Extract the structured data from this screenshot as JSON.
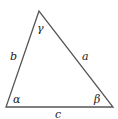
{
  "diagram": {
    "type": "triangle",
    "vertices": {
      "top": [
        39,
        11
      ],
      "bottom_left": [
        6,
        107
      ],
      "bottom_right": [
        113,
        107
      ]
    },
    "sides": {
      "a": "a",
      "b": "b",
      "c": "c"
    },
    "angles": {
      "alpha": "α",
      "beta": "β",
      "gamma": "γ"
    },
    "colors": {
      "stroke": "#555555",
      "text": "#222222"
    }
  }
}
